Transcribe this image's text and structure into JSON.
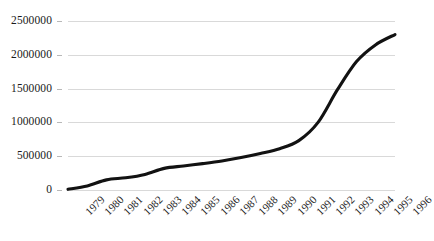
{
  "chart_data": {
    "type": "line",
    "title": "",
    "subtitle": "",
    "xlabel": "",
    "ylabel": "",
    "grid": true,
    "legend": false,
    "legend_position": "none",
    "series_color": "#121212",
    "gridline_color": "#d9d9d9",
    "background_color": "#ffffff",
    "xlim": [
      1979,
      1996
    ],
    "ylim": [
      0,
      2500000
    ],
    "ytick_labels": [
      "0",
      "500000",
      "1000000",
      "1500000",
      "2000000",
      "2500000"
    ],
    "ytick_values": [
      0,
      500000,
      1000000,
      1500000,
      2000000,
      2500000
    ],
    "categories": [
      "1979",
      "1980",
      "1981",
      "1982",
      "1983",
      "1984",
      "1985",
      "1986",
      "1987",
      "1988",
      "1989",
      "1990",
      "1991",
      "1992",
      "1993",
      "1994",
      "1995",
      "1996"
    ],
    "values": [
      10000,
      60000,
      150000,
      180000,
      230000,
      320000,
      355000,
      390000,
      430000,
      480000,
      540000,
      610000,
      730000,
      1000000,
      1480000,
      1900000,
      2150000,
      2300000
    ],
    "series": [
      {
        "name": "Series 1",
        "values": [
          10000,
          60000,
          150000,
          180000,
          230000,
          320000,
          355000,
          390000,
          430000,
          480000,
          540000,
          610000,
          730000,
          1000000,
          1480000,
          1900000,
          2150000,
          2300000
        ]
      }
    ]
  }
}
